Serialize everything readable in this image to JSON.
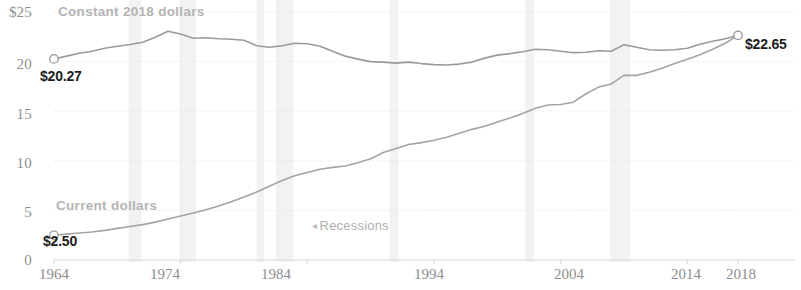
{
  "chart_data": {
    "type": "line",
    "title": "",
    "subtitle": "",
    "xlabel": "",
    "ylabel": "",
    "xlim": [
      1964,
      2018
    ],
    "ylim": [
      0,
      25
    ],
    "grid": true,
    "legend_position": "inline-annotation",
    "y_ticks": [
      "$25",
      "20",
      "15",
      "10",
      "5",
      "0"
    ],
    "y_tick_values": [
      25,
      20,
      15,
      10,
      5,
      0
    ],
    "x_ticks": [
      "1964",
      "1974",
      "1984",
      "1994",
      "2004",
      "2014",
      "2018"
    ],
    "x_tick_values": [
      1964,
      1974,
      1984,
      1994,
      2004,
      2014,
      2018
    ],
    "series": [
      {
        "name": "Constant 2018 dollars",
        "color": "#9a9a9a",
        "start_label": "$20.27",
        "start_value": 20.27,
        "end_label": "$22.65",
        "end_value": 22.65,
        "x": [
          1964,
          1965,
          1966,
          1967,
          1968,
          1969,
          1970,
          1971,
          1972,
          1973,
          1974,
          1975,
          1976,
          1977,
          1978,
          1979,
          1980,
          1981,
          1982,
          1983,
          1984,
          1985,
          1986,
          1987,
          1988,
          1989,
          1990,
          1991,
          1992,
          1993,
          1994,
          1995,
          1996,
          1997,
          1998,
          1999,
          2000,
          2001,
          2002,
          2003,
          2004,
          2005,
          2006,
          2007,
          2008,
          2009,
          2010,
          2011,
          2012,
          2013,
          2014,
          2015,
          2016,
          2017,
          2018
        ],
        "values": [
          20.27,
          20.55,
          20.85,
          21.05,
          21.35,
          21.55,
          21.72,
          21.95,
          22.45,
          23.05,
          22.78,
          22.35,
          22.4,
          22.3,
          22.25,
          22.15,
          21.6,
          21.45,
          21.6,
          21.85,
          21.8,
          21.55,
          21.05,
          20.55,
          20.25,
          20.0,
          19.95,
          19.85,
          19.95,
          19.8,
          19.7,
          19.65,
          19.75,
          19.95,
          20.35,
          20.65,
          20.8,
          21.0,
          21.25,
          21.2,
          21.05,
          20.9,
          20.95,
          21.1,
          21.05,
          21.7,
          21.45,
          21.2,
          21.15,
          21.2,
          21.35,
          21.75,
          22.05,
          22.3,
          22.65
        ],
        "linewidth": 1.6
      },
      {
        "name": "Current dollars",
        "color": "#a4a4a4",
        "start_label": "$2.50",
        "start_value": 2.5,
        "end_label": "$22.65",
        "end_value": 22.65,
        "x": [
          1964,
          1965,
          1966,
          1967,
          1968,
          1969,
          1970,
          1971,
          1972,
          1973,
          1974,
          1975,
          1976,
          1977,
          1978,
          1979,
          1980,
          1981,
          1982,
          1983,
          1984,
          1985,
          1986,
          1987,
          1988,
          1989,
          1990,
          1991,
          1992,
          1993,
          1994,
          1995,
          1996,
          1997,
          1998,
          1999,
          2000,
          2001,
          2002,
          2003,
          2004,
          2005,
          2006,
          2007,
          2008,
          2009,
          2010,
          2011,
          2012,
          2013,
          2014,
          2015,
          2016,
          2017,
          2018
        ],
        "values": [
          2.5,
          2.61,
          2.72,
          2.83,
          2.99,
          3.19,
          3.37,
          3.57,
          3.82,
          4.14,
          4.43,
          4.73,
          5.06,
          5.44,
          5.88,
          6.34,
          6.85,
          7.44,
          8.02,
          8.49,
          8.83,
          9.14,
          9.34,
          9.47,
          9.8,
          10.2,
          10.83,
          11.23,
          11.64,
          11.83,
          12.07,
          12.37,
          12.78,
          13.17,
          13.49,
          13.9,
          14.32,
          14.76,
          15.29,
          15.63,
          15.67,
          15.91,
          16.76,
          17.43,
          17.75,
          18.62,
          18.61,
          18.93,
          19.33,
          19.81,
          20.23,
          20.7,
          21.25,
          21.85,
          22.65
        ],
        "linewidth": 1.6
      }
    ],
    "recession_bands": [
      {
        "start": 1969.9,
        "end": 1970.9
      },
      {
        "start": 1973.9,
        "end": 1975.2
      },
      {
        "start": 1980.0,
        "end": 1980.6
      },
      {
        "start": 1981.5,
        "end": 1982.9
      },
      {
        "start": 1990.5,
        "end": 1991.2
      },
      {
        "start": 2001.2,
        "end": 2001.9
      },
      {
        "start": 2007.9,
        "end": 2009.5
      }
    ],
    "recession_band_color": "#f2f2f2",
    "annotations": [
      {
        "text": "Recessions",
        "arrow": "◂",
        "x": 1984.4,
        "y": 3.4
      }
    ],
    "axis_color": "#d8d8d8",
    "grid_color": "#e6e6e6",
    "marker_style": "open-circle",
    "marker_color": "#ffffff",
    "marker_stroke": "#8e8e8e"
  },
  "axis": {
    "y_labels": [
      "$25",
      "20",
      "15",
      "10",
      "5",
      "0"
    ],
    "x_labels": [
      "1964",
      "1974",
      "1984",
      "1994",
      "2004",
      "2014",
      "2018"
    ]
  },
  "labels": {
    "constant_series": "Constant 2018 dollars",
    "current_series": "Current dollars",
    "constant_start": "$20.27",
    "converged_end": "$22.65",
    "current_start": "$2.50",
    "recessions": "Recessions",
    "recessions_arrow": "◂"
  }
}
